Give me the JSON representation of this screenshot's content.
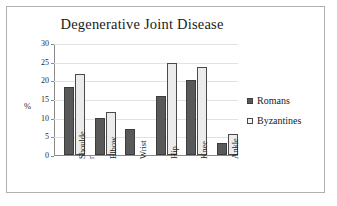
{
  "chart_data": {
    "type": "bar",
    "title": "Degenerative Joint Disease",
    "xlabel": "",
    "ylabel": "%",
    "ylim": [
      0,
      30
    ],
    "yticks": [
      0,
      5,
      10,
      15,
      20,
      25,
      30
    ],
    "ytick_labels": [
      "0",
      "5",
      "10",
      "15",
      "20",
      "25",
      "30"
    ],
    "grid": true,
    "legend_position": "right",
    "categories": [
      "Shoulder",
      "Elbow",
      "Wrist",
      "Hip",
      "Knee",
      "Ankle"
    ],
    "category_labels": [
      "Shoulde\nr",
      "Elbow",
      "Wrist",
      "Hip",
      "Knee",
      "Ankle"
    ],
    "series": [
      {
        "name": "Romans",
        "color": "#595959",
        "values": [
          18.1,
          10.0,
          7.1,
          15.9,
          20.0,
          3.1
        ]
      },
      {
        "name": "Byzantines",
        "color": "#ececec",
        "values": [
          21.6,
          11.4,
          null,
          24.7,
          23.7,
          5.5
        ]
      }
    ]
  },
  "legend": {
    "items": [
      {
        "label": "Romans",
        "swatch": "filled-square-icon"
      },
      {
        "label": "Byzantines",
        "swatch": "outlined-square-icon"
      }
    ]
  }
}
